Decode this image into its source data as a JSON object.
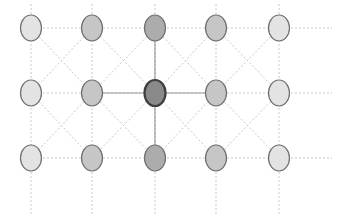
{
  "diagram": {
    "type": "grid-graph",
    "columns_x": [
      31,
      92,
      155,
      216,
      279
    ],
    "rows_y": [
      28,
      93,
      158
    ],
    "node_rx": 10.5,
    "node_ry": 13,
    "grid_extent": {
      "right_x": 332,
      "top_y": 4,
      "bottom_y": 216
    },
    "colors": {
      "background": "#ffffff",
      "edge": "#c8c8c8",
      "edge_strong": "#9a9a9a",
      "node_stroke": "#6f6f6f",
      "center_stroke": "#3e3e3e",
      "shade_light": "#e3e3e3",
      "shade_medium": "#c6c6c6",
      "shade_dark": "#acacac",
      "shade_center": "#8a8a8a"
    },
    "nodes": [
      {
        "row": 0,
        "col": 0,
        "shade": "light"
      },
      {
        "row": 0,
        "col": 1,
        "shade": "medium"
      },
      {
        "row": 0,
        "col": 2,
        "shade": "dark"
      },
      {
        "row": 0,
        "col": 3,
        "shade": "medium"
      },
      {
        "row": 0,
        "col": 4,
        "shade": "light"
      },
      {
        "row": 1,
        "col": 0,
        "shade": "light"
      },
      {
        "row": 1,
        "col": 1,
        "shade": "medium"
      },
      {
        "row": 1,
        "col": 2,
        "shade": "center"
      },
      {
        "row": 1,
        "col": 3,
        "shade": "medium"
      },
      {
        "row": 1,
        "col": 4,
        "shade": "light"
      },
      {
        "row": 2,
        "col": 0,
        "shade": "light"
      },
      {
        "row": 2,
        "col": 1,
        "shade": "medium"
      },
      {
        "row": 2,
        "col": 2,
        "shade": "dark"
      },
      {
        "row": 2,
        "col": 3,
        "shade": "medium"
      },
      {
        "row": 2,
        "col": 4,
        "shade": "light"
      }
    ],
    "highlighted_node": {
      "row": 1,
      "col": 2
    }
  }
}
